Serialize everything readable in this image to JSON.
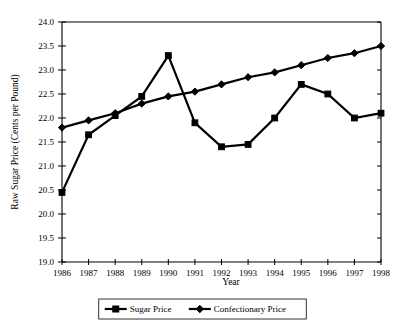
{
  "chart_data": {
    "type": "line",
    "title": "",
    "xlabel": "Year",
    "ylabel": "Raw Sugar Price (Cents per Pound)",
    "categories": [
      1986,
      1987,
      1988,
      1989,
      1990,
      1991,
      1992,
      1993,
      1994,
      1995,
      1996,
      1997,
      1998
    ],
    "x_tick_labels": [
      "1986",
      "1987",
      "1988",
      "1989",
      "1990",
      "1991",
      "1992",
      "1993",
      "1994",
      "1995",
      "1996",
      "1997",
      "1998"
    ],
    "y_tick_labels": [
      "19.0",
      "19.5",
      "20.0",
      "20.5",
      "21.0",
      "21.5",
      "22.0",
      "22.5",
      "23.0",
      "23.5",
      "24.0"
    ],
    "y_ticks": [
      19.0,
      19.5,
      20.0,
      20.5,
      21.0,
      21.5,
      22.0,
      22.5,
      23.0,
      23.5,
      24.0
    ],
    "ylim": [
      19.0,
      24.0
    ],
    "xlim": [
      1986,
      1998
    ],
    "grid": false,
    "legend_position": "bottom",
    "series": [
      {
        "name": "Sugar Price",
        "marker": "square",
        "values": [
          20.45,
          21.65,
          22.05,
          22.45,
          23.3,
          21.9,
          21.4,
          21.45,
          22.0,
          22.7,
          22.5,
          22.0,
          22.1
        ]
      },
      {
        "name": "Confectionary Price",
        "marker": "diamond",
        "values": [
          21.8,
          21.95,
          22.1,
          22.3,
          22.45,
          22.55,
          22.7,
          22.85,
          22.95,
          23.1,
          23.25,
          23.35,
          23.5
        ]
      }
    ]
  },
  "legend": {
    "entries": [
      {
        "label": "Sugar Price",
        "marker": "square"
      },
      {
        "label": "Confectionary Price",
        "marker": "diamond"
      }
    ]
  }
}
